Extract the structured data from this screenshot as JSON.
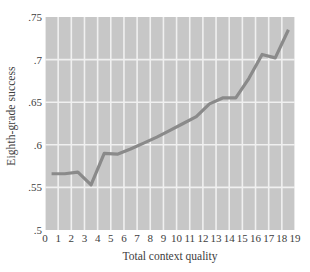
{
  "chart_data": {
    "type": "line",
    "title": "",
    "subtitle": "",
    "xlabel": "Total context quality",
    "ylabel": "Eighth-grade success",
    "xlim": [
      0,
      19
    ],
    "ylim": [
      0.5,
      0.75
    ],
    "grid": true,
    "legend": null,
    "legend_position": "none",
    "xticks": [
      "0",
      "1",
      "2",
      "3",
      "4",
      "5",
      "6",
      "7",
      "8",
      "9",
      "10",
      "11",
      "12",
      "13",
      "14",
      "15",
      "16",
      "17",
      "18",
      "19"
    ],
    "xtick_values": [
      0,
      1,
      2,
      3,
      4,
      5,
      6,
      7,
      8,
      9,
      10,
      11,
      12,
      13,
      14,
      15,
      16,
      17,
      18,
      19
    ],
    "yticks": [
      ".5",
      ".55",
      ".6",
      ".65",
      ".7",
      ".75"
    ],
    "ytick_values": [
      0.5,
      0.55,
      0.6,
      0.65,
      0.7,
      0.75
    ],
    "x": [
      0.5,
      1.5,
      2.5,
      3.5,
      4.5,
      5.5,
      6.5,
      7.5,
      8.5,
      9.5,
      10.5,
      11.5,
      12.5,
      13.5,
      14.5,
      15.5,
      16.5,
      17.5,
      18.5
    ],
    "values": [
      0.566,
      0.566,
      0.568,
      0.553,
      0.59,
      0.589,
      0.595,
      0.602,
      0.609,
      0.617,
      0.625,
      0.633,
      0.648,
      0.655,
      0.655,
      0.678,
      0.706,
      0.702,
      0.735
    ],
    "series": [
      {
        "name": "Eighth-grade success",
        "x": [
          0.5,
          1.5,
          2.5,
          3.5,
          4.5,
          5.5,
          6.5,
          7.5,
          8.5,
          9.5,
          10.5,
          11.5,
          12.5,
          13.5,
          14.5,
          15.5,
          16.5,
          17.5,
          18.5
        ],
        "values": [
          0.566,
          0.566,
          0.568,
          0.553,
          0.59,
          0.589,
          0.595,
          0.602,
          0.609,
          0.617,
          0.625,
          0.633,
          0.648,
          0.655,
          0.655,
          0.678,
          0.706,
          0.702,
          0.735
        ]
      }
    ]
  },
  "style": {
    "plot_background": "#c7c7c7",
    "gridline_color": "#f0f0f0",
    "line_color": "#8a8a8a",
    "text_color": "#3d3d3d",
    "page_background": "#ffffff"
  }
}
